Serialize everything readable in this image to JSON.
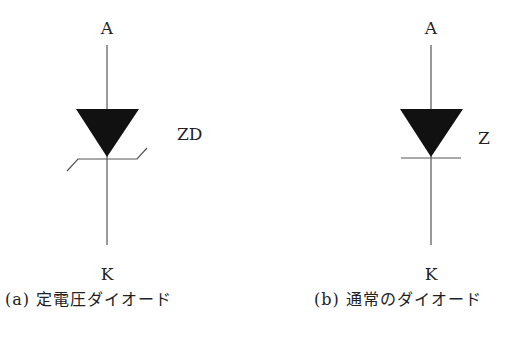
{
  "figure_a": {
    "anode_label": "A",
    "cathode_label": "K",
    "symbol_label": "ZD",
    "caption": "(a) 定電圧ダイオード",
    "symbol": "zener-diode"
  },
  "figure_b": {
    "anode_label": "A",
    "cathode_label": "K",
    "symbol_label": "Z",
    "caption": "(b) 通常のダイオード",
    "symbol": "diode"
  },
  "colors": {
    "stroke": "#555555",
    "fill": "#111111",
    "text": "#222222",
    "background": "#ffffff"
  }
}
